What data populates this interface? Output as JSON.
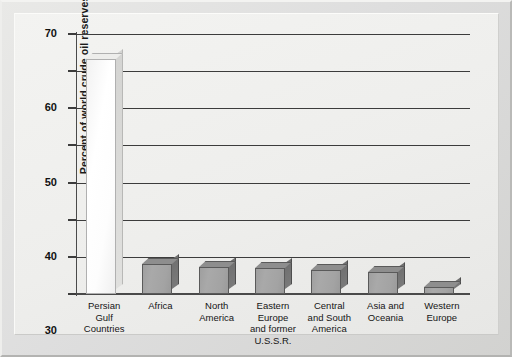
{
  "chart_data": {
    "type": "bar",
    "title": "",
    "subtitle": "",
    "xlabel": "",
    "ylabel": "Percent of world crude oil reserves, 1998",
    "ylim": [
      0,
      70
    ],
    "ytick_step": 10,
    "yticks": [
      "70",
      "60",
      "50",
      "40",
      "30",
      "20",
      "10",
      "0"
    ],
    "grid": "horizontal",
    "legend": "none",
    "categories": [
      "Persian\nGulf\nCountries",
      "Africa",
      "North\nAmerica",
      "Eastern Europe\nand former\nU.S.S.R.",
      "Central\nand South\nAmerica",
      "Asia and\nOceania",
      "Western\nEurope"
    ],
    "values": [
      63.3,
      8.0,
      7.3,
      7.0,
      6.5,
      6.0,
      2.0
    ],
    "highlight_index": 0,
    "colors": {
      "bar_face": "#a5a5a5",
      "bar_side": "#757575",
      "bar_outline": "#5a5a5a",
      "bar_highlight_face": "#ffffff",
      "plot_background": "#eeeeec",
      "gridline": "#3c3c3c",
      "axis": "#4a4a4a",
      "text": "#111111",
      "frame": "#d9d9d7"
    }
  }
}
